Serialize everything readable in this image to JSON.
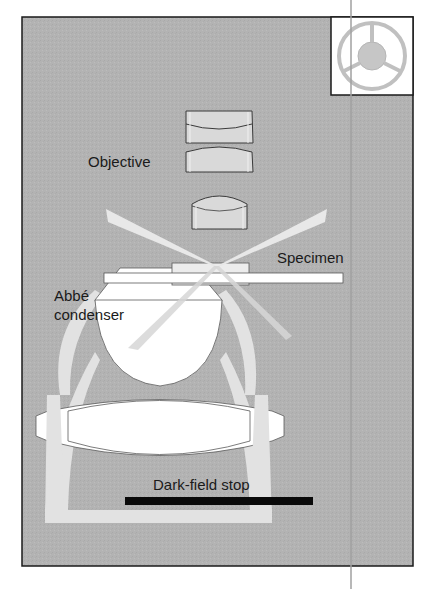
{
  "figure": {
    "labels": {
      "objective": "Objective",
      "specimen": "Specimen",
      "condenser_line1": "Abbé",
      "condenser_line2": "condenser",
      "stop": "Dark-field stop"
    },
    "inset": {
      "description": "Dark-field stop (annular) plan view"
    },
    "colors": {
      "background": "#b4b4b4",
      "frame": "#1a1a1a",
      "light_beam": "#e6e6e6",
      "lens_fill": "#d9d9d9",
      "lens_outline": "#3a3a3a",
      "condenser_glass": "#ffffff",
      "stop_bar": "#0a0a0a",
      "inset_ring": "#bdbdbd",
      "inset_center": "#c4c4c4",
      "guide_line": "#9e9e9e"
    }
  }
}
